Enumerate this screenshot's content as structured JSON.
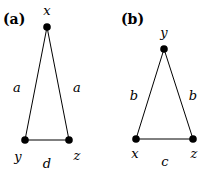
{
  "panels": [
    {
      "id": "a",
      "label": "(a)",
      "nodes": [
        {
          "name": "x",
          "cx": 47,
          "cy": 27
        },
        {
          "name": "y",
          "cx": 25,
          "cy": 140
        },
        {
          "name": "z",
          "cx": 69,
          "cy": 140
        }
      ],
      "node_labels": {
        "top": "x",
        "bottom_left": "y",
        "bottom_right": "z"
      },
      "edge_labels": {
        "left": "a",
        "right": "a",
        "bottom": "d"
      }
    },
    {
      "id": "b",
      "label": "(b)",
      "nodes": [
        {
          "name": "y",
          "cx": 164,
          "cy": 49
        },
        {
          "name": "x",
          "cx": 136,
          "cy": 139
        },
        {
          "name": "z",
          "cx": 193,
          "cy": 139
        }
      ],
      "node_labels": {
        "top": "y",
        "bottom_left": "x",
        "bottom_right": "z"
      },
      "edge_labels": {
        "left": "b",
        "right": "b",
        "bottom": "c"
      }
    }
  ],
  "colors": {
    "stroke": "#000000",
    "node": "#000000",
    "background": "#ffffff"
  }
}
